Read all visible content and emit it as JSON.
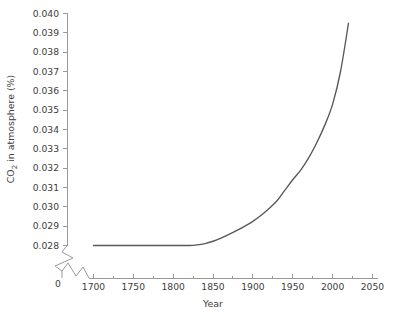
{
  "chart_data": {
    "type": "line",
    "title": "",
    "xlabel": "Year",
    "ylabel": "CO2 in atmosphere (%)",
    "ylabel_parts": {
      "pre": "CO",
      "sub": "2",
      "post": " in atmosphere (%)"
    },
    "xlim": [
      1700,
      2050
    ],
    "ylim": [
      0.028,
      0.04
    ],
    "grid": false,
    "legend": null,
    "axis_breaks": {
      "y": {
        "present": true,
        "below_label": "0",
        "break_above": 0.028
      },
      "x": {
        "present": true,
        "break_before": 1700
      }
    },
    "x_ticks": [
      1700,
      1750,
      1800,
      1850,
      1900,
      1950,
      2000,
      2050
    ],
    "x_minor_ticks": [
      1725,
      1775,
      1825,
      1875,
      1925,
      1975,
      2025
    ],
    "y_ticks": [
      0.04,
      0.039,
      0.038,
      0.037,
      0.036,
      0.035,
      0.034,
      0.033,
      0.032,
      0.031,
      0.03,
      0.029,
      0.028
    ],
    "y_tick_labels": [
      "0.040",
      "0.039",
      "0.038",
      "0.037",
      "0.036",
      "0.035",
      "0.034",
      "0.033",
      "0.032",
      "0.031",
      "0.030",
      "0.029",
      "0.028"
    ],
    "x_tick_labels": [
      "1700",
      "1750",
      "1800",
      "1850",
      "1900",
      "1950",
      "2000",
      "2050"
    ],
    "origin_label": "0",
    "series": [
      {
        "name": "CO2 concentration",
        "color": "#585858",
        "x": [
          1700,
          1720,
          1740,
          1760,
          1780,
          1800,
          1820,
          1830,
          1840,
          1850,
          1860,
          1870,
          1880,
          1890,
          1900,
          1910,
          1920,
          1930,
          1940,
          1950,
          1960,
          1970,
          1980,
          1990,
          2000,
          2010,
          2020
        ],
        "y": [
          0.028,
          0.028,
          0.028,
          0.028,
          0.028,
          0.028,
          0.028,
          0.02803,
          0.0281,
          0.02822,
          0.02838,
          0.02857,
          0.02878,
          0.029,
          0.02925,
          0.02955,
          0.0299,
          0.0303,
          0.03085,
          0.0314,
          0.0319,
          0.03253,
          0.0333,
          0.0342,
          0.0353,
          0.037,
          0.0395
        ]
      }
    ]
  },
  "colors": {
    "line": "#585858",
    "axis": "#9a9a9a",
    "text": "#3c3c3c",
    "background": "#ffffff"
  }
}
